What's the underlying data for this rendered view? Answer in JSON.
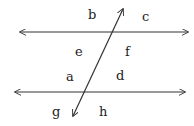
{
  "diagram": {
    "stroke_color": "#333333",
    "lines": [
      {
        "name": "top-parallel-line",
        "x1": 20,
        "y1": 32,
        "x2": 188,
        "y2": 32
      },
      {
        "name": "bottom-parallel-line",
        "x1": 15,
        "y1": 92,
        "x2": 185,
        "y2": 92
      },
      {
        "name": "transversal-line",
        "x1": 123,
        "y1": 9,
        "x2": 73,
        "y2": 116
      }
    ],
    "labels": {
      "b": "b",
      "c": "c",
      "e": "e",
      "f": "f",
      "a": "a",
      "d": "d",
      "g": "g",
      "h": "h"
    }
  }
}
